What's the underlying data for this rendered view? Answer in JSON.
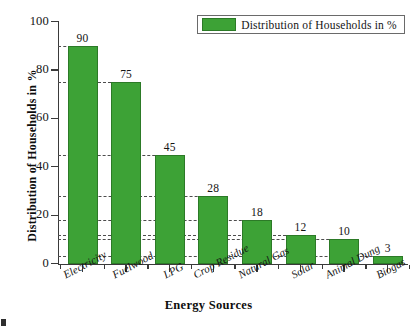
{
  "chart_data": {
    "type": "bar",
    "title": "",
    "categories": [
      "Electricity",
      "Fuelwood",
      "LPG",
      "Crop Residue",
      "Natural Gas",
      "Solar",
      "Animal Dung",
      "Biogas"
    ],
    "values": [
      90,
      75,
      45,
      28,
      18,
      12,
      10,
      3
    ],
    "series": [
      {
        "name": "Distribution of Households in %",
        "values": [
          90,
          75,
          45,
          28,
          18,
          12,
          10,
          3
        ],
        "color": "#3da236"
      }
    ],
    "xlabel": "Energy Sources",
    "ylabel": "Distribution of Households in %",
    "ylim": [
      0,
      100
    ],
    "yticks": [
      0,
      20,
      40,
      60,
      80,
      100
    ],
    "ytick_labels": [
      "0",
      "20",
      "40",
      "60",
      "80",
      "100"
    ],
    "grid": "dashed horizontal lines at each bar value, drawn from y-axis to the bar",
    "legend_position": "top-right",
    "bar_color": "#3da236",
    "bar_edge_color": "#2c7a27",
    "axis_color": "#3a3a3a"
  },
  "legend": {
    "entries": [
      {
        "label": "Distribution of Households in %",
        "color": "#3da236"
      }
    ]
  },
  "axes": {
    "x_title": "Energy Sources",
    "y_title": "Distribution of Households in %"
  }
}
